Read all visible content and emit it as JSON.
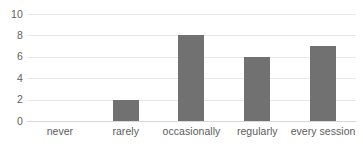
{
  "chart_data": {
    "type": "bar",
    "title": "",
    "subtitle": "",
    "xlabel": "",
    "ylabel": "",
    "categories": [
      "never",
      "rarely",
      "occasionally",
      "regularly",
      "every session"
    ],
    "values": [
      0,
      2,
      8,
      6,
      7
    ],
    "series": [
      {
        "name": "responses",
        "values": [
          0,
          2,
          8,
          6,
          7
        ]
      }
    ],
    "ylim": [
      0,
      10
    ],
    "yticks": [
      0,
      2,
      4,
      6,
      8,
      10
    ],
    "ytick_labels": [
      "0",
      "2",
      "4",
      "6",
      "8",
      "10"
    ],
    "xtick_labels": [
      "never",
      "rarely",
      "occasionally",
      "regularly",
      "every session"
    ],
    "grid": "horizontal",
    "legend": "none",
    "annotations": [],
    "colors": {
      "bar": "#717171",
      "gridline": "#e8e8e8",
      "baseline": "#d9d9d9",
      "tick_text": "#616161",
      "category_text": "#5c5c5c",
      "background": "#ffffff"
    }
  }
}
